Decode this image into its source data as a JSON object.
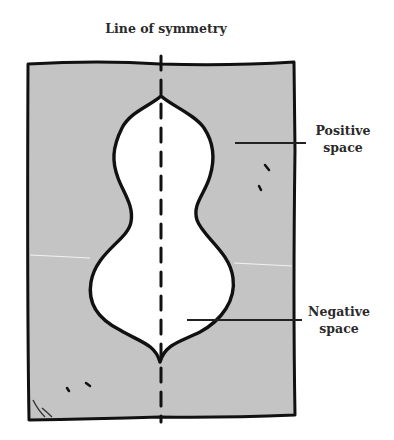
{
  "diagram": {
    "title": "Line of symmetry",
    "labels": {
      "positive": {
        "line1": "Positive",
        "line2": "space"
      },
      "negative": {
        "line1": "Negative",
        "line2": "space"
      }
    },
    "colors": {
      "frame_fill": "#c4c4c4",
      "shape_fill": "#ffffff",
      "stroke": "#111111",
      "text": "#2a2a2a"
    },
    "elements": [
      "rectangular gray frame (positive space)",
      "white vase-shaped cutout (negative space)",
      "dashed vertical line of symmetry",
      "leader line to Positive space",
      "leader line to Negative space"
    ]
  }
}
